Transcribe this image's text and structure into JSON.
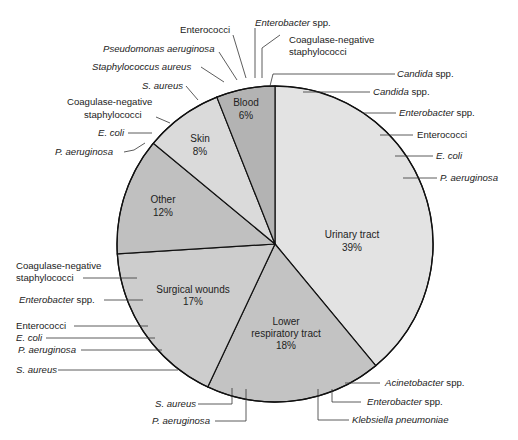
{
  "chart_data": {
    "type": "pie",
    "title": "",
    "categories": [
      "Urinary tract",
      "Lower respiratory tract",
      "Surgical wounds",
      "Other",
      "Skin",
      "Blood"
    ],
    "values": [
      39,
      18,
      17,
      12,
      8,
      6
    ],
    "unit": "%",
    "colors": [
      "#e3e3e3",
      "#c3c3c3",
      "#cdcdcd",
      "#c0c0c0",
      "#dadada",
      "#b3b3b3"
    ],
    "slice_labels": [
      {
        "name": "Urinary tract",
        "pct": "39%"
      },
      {
        "name": "Lower respiratory tract",
        "line1": "Lower",
        "line2": "respiratory tract",
        "pct": "18%"
      },
      {
        "name": "Surgical wounds",
        "pct": "17%"
      },
      {
        "name": "Other",
        "pct": "12%"
      },
      {
        "name": "Skin",
        "pct": "8%"
      },
      {
        "name": "Blood",
        "pct": "6%"
      }
    ],
    "annotations": {
      "Urinary tract": [
        "Candida spp.",
        "Enterobacter spp.",
        "Enterococci",
        "E. coli",
        "P. aeruginosa"
      ],
      "Lower respiratory tract": [
        "Acinetobacter spp.",
        "Enterobacter spp.",
        "Klebsiella pneumoniae",
        "P. aeruginosa",
        "S. aureus"
      ],
      "Surgical wounds": [
        "Coagulase-negative staphylococci",
        "Enterobacter spp.",
        "Enterococci",
        "E. coli",
        "P. aeruginosa",
        "S. aureus"
      ],
      "Skin": [
        "S. aureus",
        "Coagulase-negative staphylococci",
        "E. coli",
        "P. aeruginosa"
      ],
      "Blood": [
        "Staphylococcus aureus",
        "Pseudomonas aeruginosa",
        "Enterococci",
        "Enterobacter spp.",
        "Coagulase-negative staphylococci",
        "Candida spp."
      ]
    },
    "legend": "none"
  },
  "labels": {
    "top": {
      "enterococci": "Enterococci",
      "enterobacter_genus": "Enterobacter",
      "enterobacter_spp": " spp.",
      "cons_1": "Coagulase-negative",
      "cons_2": "staphylococci",
      "pseudomonas": "Pseudomonas aeruginosa",
      "staph_aureus": "Staphylococcus aureus",
      "candida_blood_genus": "Candida",
      "candida_blood_spp": " spp."
    },
    "skin": {
      "s_aureus": "S. aureus",
      "cons_1": "Coagulase-negative",
      "cons_2": "staphylococci",
      "e_coli": "E. coli",
      "p_aeruginosa": "P. aeruginosa"
    },
    "urinary": {
      "candida_genus": "Candida",
      "candida_spp": " spp.",
      "enterobacter_genus": "Enterobacter",
      "enterobacter_spp": " spp.",
      "enterococci": "Enterococci",
      "e_coli": "E. coli",
      "p_aeruginosa": "P. aeruginosa"
    },
    "surgical": {
      "cons_1": "Coagulase-negative",
      "cons_2": "staphylococci",
      "enterobacter_genus": "Enterobacter",
      "enterobacter_spp": " spp.",
      "enterococci": "Enterococci",
      "e_coli": "E. coli",
      "p_aeruginosa": "P. aeruginosa",
      "s_aureus": "S. aureus"
    },
    "respiratory": {
      "acinetobacter_genus": "Acinetobacter",
      "acinetobacter_spp": " spp.",
      "enterobacter_genus": "Enterobacter",
      "enterobacter_spp": " spp.",
      "klebsiella": "Klebsiella pneumoniae",
      "s_aureus": "S. aureus",
      "p_aeruginosa": "P. aeruginosa"
    }
  }
}
